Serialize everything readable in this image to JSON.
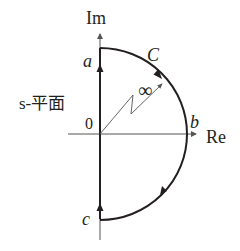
{
  "diagram": {
    "plane_label": "s-平面",
    "axes": {
      "imaginary_label": "Im",
      "real_label": "Re",
      "origin_label": "0"
    },
    "points": {
      "a": "a",
      "b": "b",
      "c": "c"
    },
    "contour_label": "C",
    "radius_label": "∞",
    "colors": {
      "stroke": "#231f20",
      "axis": "#555555",
      "background": "#ffffff"
    }
  }
}
